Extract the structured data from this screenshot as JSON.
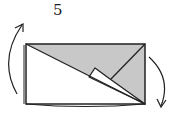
{
  "diagram": {
    "step_number": "5",
    "type": "origami-fold-step",
    "colors": {
      "paper_front": "#ffffff",
      "paper_back": "#c8c8c8",
      "stroke": "#222222"
    },
    "arrows": [
      {
        "name": "turn-over-arrow-left",
        "direction": "up"
      },
      {
        "name": "turn-over-arrow-right",
        "direction": "down"
      }
    ]
  }
}
